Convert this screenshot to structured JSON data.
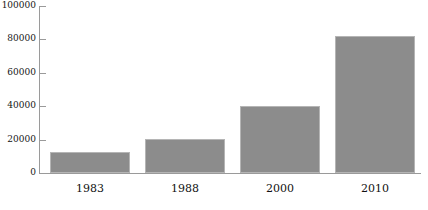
{
  "chart_data": {
    "type": "bar",
    "title": "",
    "subtitle": "",
    "xlabel": "",
    "ylabel": "",
    "categories": [
      "1983",
      "1988",
      "2000",
      "2010"
    ],
    "values": [
      12600,
      20400,
      40100,
      82000
    ],
    "series": [
      {
        "name": "",
        "values": [
          12600,
          20400,
          40100,
          82000
        ]
      }
    ],
    "ylim": [
      0,
      100000
    ],
    "yticks": [
      0,
      20000,
      40000,
      60000,
      80000,
      100000
    ],
    "ytick_labels": [
      "0",
      "20000",
      "40000",
      "60000",
      "80000",
      "100000"
    ],
    "grid": false,
    "legend": false,
    "legend_position": "none",
    "bar_color": "#8c8c8c",
    "bar_edge_color": "#b5b5b5",
    "axis_color": "#9a9a9a",
    "text_color": "#111111"
  }
}
